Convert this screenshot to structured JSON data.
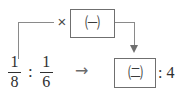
{
  "figure": {
    "type": "math-ratio-diagram",
    "operator_symbol": "×",
    "transform_arrow": "→"
  },
  "top_box": {
    "label": "㈠"
  },
  "result_box": {
    "label": "㈡"
  },
  "ratio_left": {
    "first_fraction": {
      "numerator": "1",
      "denominator": "8"
    },
    "separator": ":",
    "second_fraction": {
      "numerator": "1",
      "denominator": "6"
    }
  },
  "ratio_right": {
    "separator": ":",
    "value": "4",
    "tail_text": ": 4"
  },
  "colors": {
    "line": "#8a8a8a",
    "box_border": "#6f6f6f",
    "text": "#2f2f2f",
    "arrow": "#6f6f6f",
    "background": "#ffffff"
  }
}
